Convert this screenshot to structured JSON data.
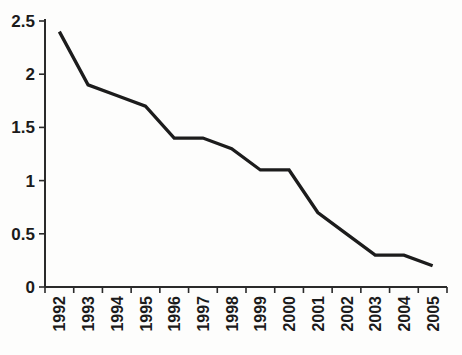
{
  "chart_data": {
    "type": "line",
    "title": "",
    "xlabel": "",
    "ylabel": "",
    "categories": [
      "1992",
      "1993",
      "1994",
      "1995",
      "1996",
      "1997",
      "1998",
      "1999",
      "2000",
      "2001",
      "2002",
      "2003",
      "2004",
      "2005"
    ],
    "series": [
      {
        "name": "value",
        "values": [
          2.4,
          1.9,
          1.8,
          1.7,
          1.4,
          1.4,
          1.3,
          1.1,
          1.1,
          0.7,
          0.5,
          0.3,
          0.3,
          0.2
        ]
      }
    ],
    "ylim": [
      0,
      2.5
    ],
    "ytick_step": 0.5,
    "ytick_labels": [
      "0",
      "0.5",
      "1",
      "1.5",
      "2",
      "2.5"
    ],
    "grid": false,
    "legend_position": "none",
    "line_color": "#1c1c1c",
    "axis_color": "#2a2a2a",
    "label_color": "#1b1b1b",
    "background_color": "#fdfdfc",
    "x_label_rotation_deg": -90
  }
}
